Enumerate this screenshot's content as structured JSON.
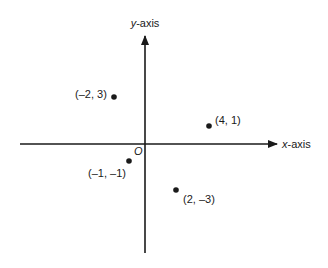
{
  "diagram": {
    "type": "cartesian-plane",
    "axes": {
      "x_label_var": "x",
      "x_label_suffix": "-axis",
      "y_label_var": "y",
      "y_label_suffix": "-axis",
      "origin_label": "O"
    },
    "points": [
      {
        "x": -2,
        "y": 3,
        "label": "(–2, 3)"
      },
      {
        "x": 4,
        "y": 1,
        "label": "(4, 1)"
      },
      {
        "x": -1,
        "y": -1,
        "label": "(–1, –1)"
      },
      {
        "x": 2,
        "y": -3,
        "label": "(2, –3)"
      }
    ],
    "colors": {
      "ink": "#1a1a1a",
      "background": "#ffffff"
    }
  }
}
